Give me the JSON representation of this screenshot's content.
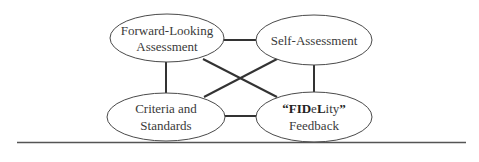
{
  "diagram": {
    "nodes": [
      {
        "id": "forward",
        "lines": [
          "Forward-Looking",
          "Assessment"
        ]
      },
      {
        "id": "self",
        "lines": [
          "Self-Assessment"
        ]
      },
      {
        "id": "criteria",
        "lines": [
          "Criteria and",
          "Standards"
        ]
      },
      {
        "id": "fidelity",
        "lines": [
          "FIDeLity",
          "Feedback"
        ],
        "rich_first_line": [
          {
            "t": "“FID",
            "bold": true
          },
          {
            "t": "e",
            "bold": false
          },
          {
            "t": "L",
            "bold": true
          },
          {
            "t": "ity",
            "bold": false
          },
          {
            "t": "”",
            "bold": true
          }
        ]
      }
    ],
    "edges": [
      [
        "forward",
        "self"
      ],
      [
        "forward",
        "criteria"
      ],
      [
        "forward",
        "fidelity"
      ],
      [
        "self",
        "criteria"
      ],
      [
        "self",
        "fidelity"
      ],
      [
        "criteria",
        "fidelity"
      ]
    ],
    "p": {
      "q_open": "“FID",
      "e": "e",
      "L": "L",
      "ity": "ity",
      "q_close": "”"
    }
  }
}
